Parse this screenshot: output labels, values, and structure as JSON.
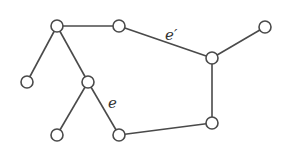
{
  "diagram": {
    "type": "graph",
    "node_radius": 6,
    "colors": {
      "stroke": "#4a4a4a",
      "node_fill": "#ffffff",
      "label": "#333333"
    },
    "nodes": [
      {
        "id": "A",
        "x": 57,
        "y": 26
      },
      {
        "id": "B",
        "x": 119,
        "y": 26
      },
      {
        "id": "C",
        "x": 265,
        "y": 27
      },
      {
        "id": "D",
        "x": 212,
        "y": 58
      },
      {
        "id": "E",
        "x": 212,
        "y": 123
      },
      {
        "id": "F",
        "x": 119,
        "y": 135
      },
      {
        "id": "G",
        "x": 57,
        "y": 135
      },
      {
        "id": "H",
        "x": 88,
        "y": 82
      },
      {
        "id": "I",
        "x": 27,
        "y": 82
      }
    ],
    "edges": [
      {
        "from": "A",
        "to": "B"
      },
      {
        "from": "B",
        "to": "D",
        "label": "e′"
      },
      {
        "from": "C",
        "to": "D"
      },
      {
        "from": "D",
        "to": "E"
      },
      {
        "from": "E",
        "to": "F"
      },
      {
        "from": "A",
        "to": "I"
      },
      {
        "from": "A",
        "to": "H"
      },
      {
        "from": "H",
        "to": "G"
      },
      {
        "from": "H",
        "to": "F",
        "label": "e"
      }
    ],
    "labels": {
      "e_prime": {
        "text": "e′",
        "x": 165,
        "y": 40
      },
      "e": {
        "text": "e",
        "x": 108,
        "y": 108
      }
    }
  }
}
